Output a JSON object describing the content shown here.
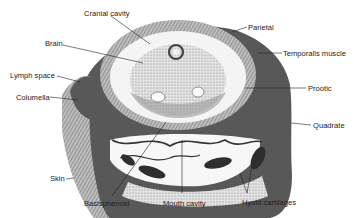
{
  "figure": {
    "type": "anatomical cross-section",
    "colors": {
      "ink": "#222222",
      "tissue_dark": "#3a3a3a",
      "tissue_mid": "#8a8a8a",
      "tissue_light": "#d6d6d6",
      "background": "#ffffff"
    }
  },
  "labels": {
    "cranial_cavity": "Cranial cavity",
    "brain": "Brain",
    "lymph_space": "Lymph space",
    "columella": "Columella",
    "skin": "Skin",
    "basisphenoid": "Basisphenoid",
    "mouth_cavity": "Mouth cavity",
    "hyoid_cartilages": "Hyoid cartilages",
    "quadrate": "Quadrate",
    "prootic": "Prootic",
    "temporalis_muscle": "Temporalis muscle",
    "parietal": "Parietal"
  }
}
